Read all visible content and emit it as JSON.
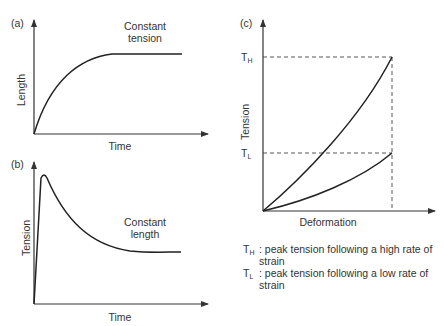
{
  "panels": {
    "a": {
      "tag": "(a)",
      "y_label": "Length",
      "x_label": "Time",
      "annotation_line1": "Constant",
      "annotation_line2": "tension"
    },
    "b": {
      "tag": "(b)",
      "y_label": "Tension",
      "x_label": "Time",
      "annotation_line1": "Constant",
      "annotation_line2": "length"
    },
    "c": {
      "tag": "(c)",
      "y_label": "Tension",
      "x_label": "Deformation",
      "th_main": "T",
      "th_sub": "H",
      "tl_main": "T",
      "tl_sub": "L"
    }
  },
  "legend": [
    {
      "key_main": "T",
      "key_sub": "H",
      "text": ": peak tension following a high rate of strain"
    },
    {
      "key_main": "T",
      "key_sub": "L",
      "text": ": peak tension following a low rate of strain"
    }
  ],
  "colors": {
    "ink": "#222222",
    "background": "#ffffff"
  }
}
